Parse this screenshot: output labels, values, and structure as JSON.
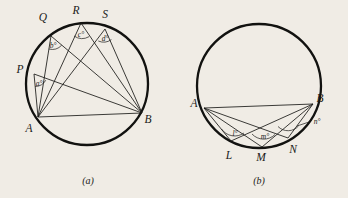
{
  "document": {
    "background_color": "#f0ece5",
    "ink_color": "#1a1a18",
    "type": "geometry-figure-pair",
    "topic": "Angles subtended by a chord in the same segment of a circle"
  },
  "figures": [
    {
      "id": "figure-a",
      "caption": "(a)",
      "circle": {
        "cx": 87,
        "cy": 84,
        "r": 61
      },
      "points": [
        {
          "name": "A",
          "label": "A",
          "x": 38,
          "y": 117,
          "label_x": 29,
          "label_y": 132
        },
        {
          "name": "B",
          "label": "B",
          "x": 142,
          "y": 113,
          "label_x": 147,
          "label_y": 123
        },
        {
          "name": "P",
          "label": "P",
          "x": 34,
          "y": 74,
          "label_x": 20,
          "label_y": 72
        },
        {
          "name": "Q",
          "label": "Q",
          "x": 51,
          "y": 36,
          "label_x": 43,
          "label_y": 20
        },
        {
          "name": "R",
          "label": "R",
          "x": 81,
          "y": 23,
          "label_x": 75,
          "label_y": 14
        },
        {
          "name": "S",
          "label": "S",
          "x": 105,
          "y": 29,
          "label_x": 104,
          "label_y": 18
        }
      ],
      "chords": [
        {
          "from": "A",
          "to": "B"
        },
        {
          "from": "P",
          "to": "A"
        },
        {
          "from": "P",
          "to": "B"
        },
        {
          "from": "Q",
          "to": "A"
        },
        {
          "from": "Q",
          "to": "B"
        },
        {
          "from": "R",
          "to": "A"
        },
        {
          "from": "R",
          "to": "B"
        },
        {
          "from": "S",
          "to": "A"
        },
        {
          "from": "S",
          "to": "B"
        }
      ],
      "angles": [
        {
          "at": "P",
          "label": "a°",
          "label_x": 37,
          "label_y": 84
        },
        {
          "at": "Q",
          "label": "b°",
          "label_x": 51,
          "label_y": 48
        },
        {
          "at": "R",
          "label": "c°",
          "label_x": 79,
          "label_y": 36
        },
        {
          "at": "S",
          "label": "d°",
          "label_x": 103,
          "label_y": 41
        }
      ]
    },
    {
      "id": "figure-b",
      "caption": "(b)",
      "circle": {
        "cx": 259,
        "cy": 86,
        "r": 62
      },
      "points": [
        {
          "name": "A",
          "label": "A",
          "x": 204,
          "y": 108,
          "label_x": 194,
          "label_y": 106
        },
        {
          "name": "B",
          "label": "B",
          "x": 313,
          "y": 104,
          "label_x": 318,
          "label_y": 102
        },
        {
          "name": "L",
          "label": "L",
          "x": 231,
          "y": 141,
          "label_x": 228,
          "label_y": 157
        },
        {
          "name": "M",
          "label": "M",
          "x": 262,
          "y": 147,
          "label_x": 258,
          "label_y": 160
        },
        {
          "name": "N",
          "label": "N",
          "x": 288,
          "y": 138,
          "label_x": 291,
          "label_y": 153
        }
      ],
      "chords": [
        {
          "from": "A",
          "to": "B"
        },
        {
          "from": "L",
          "to": "A"
        },
        {
          "from": "L",
          "to": "B"
        },
        {
          "from": "M",
          "to": "A"
        },
        {
          "from": "M",
          "to": "B"
        },
        {
          "from": "N",
          "to": "A"
        },
        {
          "from": "N",
          "to": "B"
        }
      ],
      "angles": [
        {
          "at": "L",
          "label": "l°",
          "label_x": 235,
          "label_y": 135
        },
        {
          "at": "M",
          "label": "m°",
          "label_x": 265,
          "label_y": 138
        },
        {
          "at": "N",
          "label": "n°",
          "label_x": 316,
          "label_y": 131,
          "has_leader": true
        }
      ]
    }
  ]
}
